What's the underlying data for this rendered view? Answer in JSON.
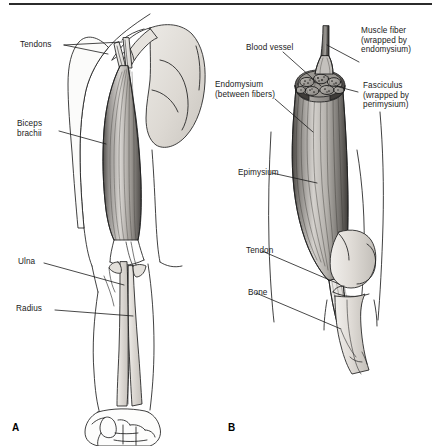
{
  "figure": {
    "panels": [
      {
        "letter": "A",
        "name": "anterior-arm-gross-anatomy",
        "labels": [
          {
            "text": "Tendons",
            "name": "label-tendons"
          },
          {
            "text": "Biceps\nbrachii",
            "name": "label-biceps-brachii"
          },
          {
            "text": "Ulna",
            "name": "label-ulna"
          },
          {
            "text": "Radius",
            "name": "label-radius"
          }
        ]
      },
      {
        "letter": "B",
        "name": "muscle-cross-section-anatomy",
        "labels": [
          {
            "text": "Blood vessel",
            "name": "label-blood-vessel"
          },
          {
            "text": "Endomysium\n(between fibers)",
            "name": "label-endomysium"
          },
          {
            "text": "Muscle fiber\n(wrapped by\nendomysium)",
            "name": "label-muscle-fiber"
          },
          {
            "text": "Fasciculus\n(wrapped by\nperimysium)",
            "name": "label-fasciculus"
          },
          {
            "text": "Epimysium",
            "name": "label-epimysium"
          },
          {
            "text": "Tendon",
            "name": "label-tendon"
          },
          {
            "text": "Bone",
            "name": "label-bone"
          }
        ]
      }
    ],
    "colors": {
      "ink": "#1a1a1a",
      "rule": "#2b2b2b",
      "bone_fill": "#dedad4",
      "muscle_light": "#c9c6c2",
      "muscle_dark": "#6e6b68",
      "tendon_fill": "#e8e6e2",
      "background": "#ffffff"
    }
  }
}
